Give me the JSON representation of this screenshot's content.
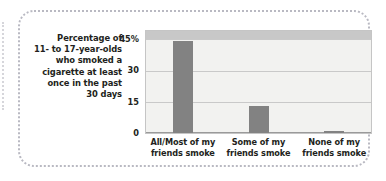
{
  "chart_data": {
    "type": "bar",
    "title": "",
    "subtitle": "",
    "caption_lines": [
      "Percentage of",
      "11- to 17-year-olds",
      "who smoked a",
      "cigarette at least",
      "once in the past",
      "30 days"
    ],
    "categories": [
      "All/Most of my friends smoke",
      "Some of my friends smoke",
      "None of my friends smoke"
    ],
    "category_lines": [
      [
        "All/Most of my",
        "friends smoke"
      ],
      [
        "Some of my",
        "friends smoke"
      ],
      [
        "None of my",
        "friends smoke"
      ]
    ],
    "values": [
      44,
      13,
      1
    ],
    "xlabel": "",
    "ylabel": "Percentage of 11- to 17-year-olds who smoked a cigarette at least once in the past 30 days",
    "ylim": [
      0,
      49
    ],
    "yticks": [
      0,
      15,
      30,
      45
    ],
    "ytick_labels": [
      "0",
      "15",
      "30",
      "45%"
    ],
    "grid": true,
    "legend": "none",
    "colors": {
      "bar": "#828282",
      "plot_background": "#f2f2f0",
      "top_band": "#c8c8c8",
      "gridline": "#c9c9c9",
      "axis": "#9a9a9a",
      "text": "#231f20",
      "frame_border": "#b9b9c2"
    }
  }
}
